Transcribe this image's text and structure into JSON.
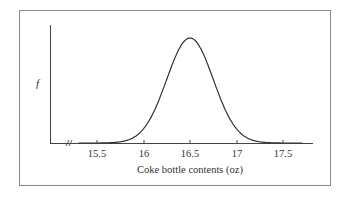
{
  "chart_data": {
    "type": "line",
    "title": "",
    "xlabel": "Coke bottle contents (oz)",
    "ylabel": "f",
    "x_ticks": [
      "15.5",
      "16",
      "16.5",
      "17",
      "17.5"
    ],
    "xlim": [
      15.2,
      17.8
    ],
    "axis_break": true,
    "series": [
      {
        "name": "normal density",
        "distribution": "normal",
        "mean": 16.5,
        "sd": 0.25,
        "x": [
          15.3,
          15.5,
          15.75,
          16.0,
          16.25,
          16.5,
          16.75,
          17.0,
          17.25,
          17.5,
          17.7
        ],
        "y": [
          0.01,
          0.05,
          0.15,
          0.37,
          0.72,
          1.0,
          0.72,
          0.37,
          0.15,
          0.05,
          0.01
        ]
      }
    ],
    "grid": false,
    "legend": null
  },
  "labels": {
    "xlabel": "Coke bottle contents (oz)",
    "ylabel": "f",
    "ticks": [
      "15.5",
      "16",
      "16.5",
      "17",
      "17.5"
    ]
  }
}
